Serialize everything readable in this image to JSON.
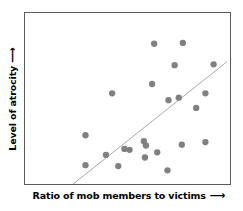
{
  "chart_data": {
    "type": "scatter",
    "title": "",
    "xlabel": "Ratio of mob members to victims",
    "ylabel": "Level of atrocity",
    "xlabel_arrow": "⟶",
    "ylabel_arrow": "⟶",
    "xlim": [
      0,
      100
    ],
    "ylim": [
      0,
      100
    ],
    "grid": false,
    "legend": false,
    "axis_ticks": false,
    "point_color": "#808080",
    "point_radius_px": 3.2,
    "frame_color": "#5a5a5a",
    "trendline": {
      "label": "linear fit",
      "color": "#a8a8a8",
      "width_px": 1,
      "x": [
        23.5,
        98.5
      ],
      "y": [
        0.0,
        71.5
      ]
    },
    "points": [
      {
        "x": 63.0,
        "y": 82.0
      },
      {
        "x": 77.0,
        "y": 82.5
      },
      {
        "x": 73.0,
        "y": 69.5
      },
      {
        "x": 92.0,
        "y": 70.0
      },
      {
        "x": 62.0,
        "y": 58.5
      },
      {
        "x": 42.5,
        "y": 53.0
      },
      {
        "x": 88.0,
        "y": 53.0
      },
      {
        "x": 70.0,
        "y": 49.0
      },
      {
        "x": 75.0,
        "y": 50.5
      },
      {
        "x": 83.5,
        "y": 44.5
      },
      {
        "x": 29.5,
        "y": 28.5
      },
      {
        "x": 58.0,
        "y": 25.0
      },
      {
        "x": 59.0,
        "y": 22.5
      },
      {
        "x": 76.5,
        "y": 23.0
      },
      {
        "x": 88.0,
        "y": 24.5
      },
      {
        "x": 48.5,
        "y": 20.5
      },
      {
        "x": 51.0,
        "y": 20.0
      },
      {
        "x": 58.5,
        "y": 15.5
      },
      {
        "x": 64.5,
        "y": 18.5
      },
      {
        "x": 39.5,
        "y": 17.0
      },
      {
        "x": 45.5,
        "y": 10.5
      },
      {
        "x": 29.5,
        "y": 11.0
      },
      {
        "x": 69.5,
        "y": 8.0
      }
    ]
  }
}
